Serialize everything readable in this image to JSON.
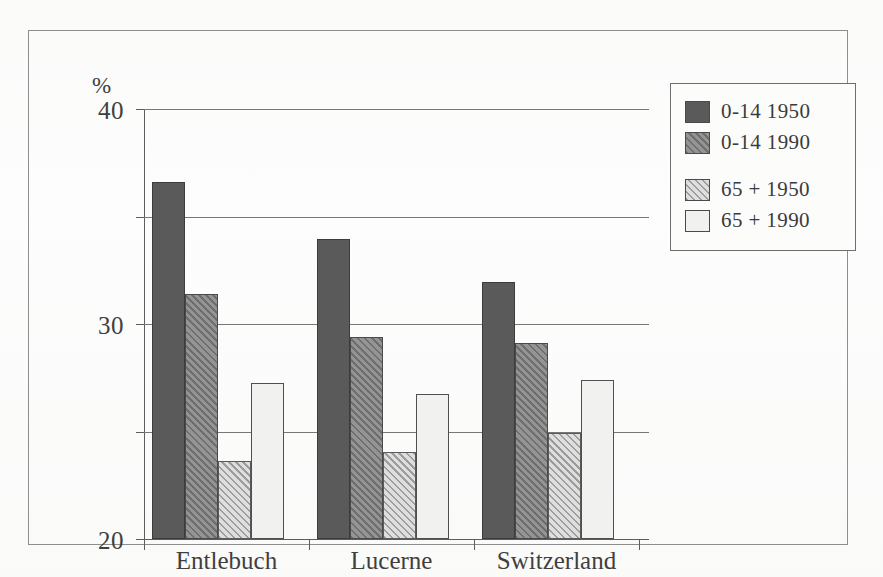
{
  "chart_data": {
    "type": "bar",
    "title": "",
    "xlabel": "",
    "ylabel": "%",
    "ylim": [
      0,
      40
    ],
    "yticks": [
      0,
      10,
      20,
      30,
      40
    ],
    "ytick_labels": [
      "0",
      "10",
      "20",
      "30",
      "40"
    ],
    "grid": true,
    "legend_position": "top-right",
    "categories": [
      "Entlebuch",
      "Lucerne",
      "Switzerland"
    ],
    "series": [
      {
        "name": "0-14  1950",
        "values": [
          33.2,
          27.9,
          23.9
        ]
      },
      {
        "name": "0-14  1990",
        "values": [
          22.8,
          18.8,
          18.2
        ]
      },
      {
        "name": "65 +  1950",
        "values": [
          7.3,
          8.1,
          9.9
        ]
      },
      {
        "name": "65 +  1990",
        "values": [
          14.5,
          13.5,
          14.8
        ]
      }
    ]
  },
  "axis": {
    "unit_label": "%",
    "ticks": [
      {
        "value": 40,
        "label": "40"
      },
      {
        "value": 30,
        "label": "30"
      },
      {
        "value": 20,
        "label": "20"
      },
      {
        "value": 10,
        "label": "10"
      },
      {
        "value": 0,
        "label": "0"
      }
    ]
  },
  "legend": {
    "items": [
      {
        "label": "0-14  1950",
        "pattern": "solid-dark-gray",
        "color": "#5a5a5a"
      },
      {
        "label": "0-14  1990",
        "pattern": "hatched-dark-gray",
        "color": "#8a8a8a"
      },
      {
        "label": "65 +  1950",
        "pattern": "hatched-light-gray",
        "color": "#c8c8c8"
      },
      {
        "label": "65 +  1990",
        "pattern": "white",
        "color": "#f1f1ef"
      }
    ]
  }
}
